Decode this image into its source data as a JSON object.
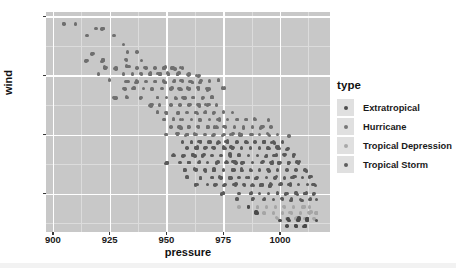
{
  "chart_data": {
    "type": "scatter",
    "title": "",
    "xlabel": "pressure",
    "ylabel": "wind",
    "xlim": [
      897,
      1022
    ],
    "ylim": [
      14,
      163
    ],
    "xticks": [
      900,
      925,
      950,
      975,
      1000
    ],
    "yticks": [
      40,
      80,
      120,
      160
    ],
    "grid": true,
    "legend": {
      "title": "type",
      "position": "right",
      "entries": [
        {
          "label": "Extratropical",
          "color": "#4d4d4d"
        },
        {
          "label": "Hurricane",
          "color": "#777777"
        },
        {
          "label": "Tropical Depression",
          "color": "#a8a8a8"
        },
        {
          "label": "Tropical Storm",
          "color": "#5e5e5e"
        }
      ]
    },
    "series": [
      {
        "name": "Hurricane",
        "color": "#6f6f6f",
        "points": [
          [
            905,
            155
          ],
          [
            910,
            155
          ],
          [
            915,
            147
          ],
          [
            919,
            152
          ],
          [
            922,
            152
          ],
          [
            927,
            147
          ],
          [
            931,
            141
          ],
          [
            918,
            135
          ],
          [
            933,
            136
          ],
          [
            937,
            136
          ],
          [
            915,
            130
          ],
          [
            922,
            130
          ],
          [
            932,
            131
          ],
          [
            939,
            130
          ],
          [
            923,
            125
          ],
          [
            928,
            125
          ],
          [
            933,
            126
          ],
          [
            937,
            125
          ],
          [
            941,
            125
          ],
          [
            945,
            125
          ],
          [
            949,
            125
          ],
          [
            953,
            125
          ],
          [
            957,
            125
          ],
          [
            920,
            121
          ],
          [
            931,
            121
          ],
          [
            935,
            121
          ],
          [
            939,
            121
          ],
          [
            943,
            121
          ],
          [
            947,
            121
          ],
          [
            951,
            121
          ],
          [
            955,
            121
          ],
          [
            960,
            121
          ],
          [
            964,
            120
          ],
          [
            925,
            117
          ],
          [
            933,
            116
          ],
          [
            937,
            116
          ],
          [
            941,
            116
          ],
          [
            945,
            116
          ],
          [
            949,
            116
          ],
          [
            953,
            116
          ],
          [
            957,
            116
          ],
          [
            961,
            116
          ],
          [
            965,
            116
          ],
          [
            969,
            116
          ],
          [
            973,
            117
          ],
          [
            931,
            111
          ],
          [
            936,
            111
          ],
          [
            940,
            111
          ],
          [
            944,
            111
          ],
          [
            948,
            111
          ],
          [
            952,
            111
          ],
          [
            956,
            111
          ],
          [
            960,
            111
          ],
          [
            964,
            111
          ],
          [
            968,
            111
          ],
          [
            975,
            111
          ],
          [
            927,
            105
          ],
          [
            933,
            105
          ],
          [
            939,
            105
          ],
          [
            946,
            105
          ],
          [
            950,
            105
          ],
          [
            954,
            105
          ],
          [
            958,
            105
          ],
          [
            962,
            105
          ],
          [
            966,
            105
          ],
          [
            970,
            105
          ],
          [
            943,
            100
          ],
          [
            947,
            100
          ],
          [
            952,
            100
          ],
          [
            956,
            100
          ],
          [
            960,
            100
          ],
          [
            964,
            100
          ],
          [
            968,
            100
          ],
          [
            972,
            100
          ],
          [
            946,
            95
          ],
          [
            950,
            95
          ],
          [
            955,
            95
          ],
          [
            959,
            95
          ],
          [
            963,
            95
          ],
          [
            967,
            95
          ],
          [
            971,
            95
          ],
          [
            975,
            95
          ],
          [
            979,
            95
          ],
          [
            949,
            90
          ],
          [
            953,
            90
          ],
          [
            957,
            90
          ],
          [
            961,
            90
          ],
          [
            965,
            90
          ],
          [
            969,
            90
          ],
          [
            973,
            90
          ],
          [
            977,
            90
          ],
          [
            981,
            90
          ],
          [
            985,
            90
          ],
          [
            989,
            90
          ],
          [
            995,
            90
          ],
          [
            952,
            85
          ],
          [
            956,
            85
          ],
          [
            960,
            85
          ],
          [
            964,
            85
          ],
          [
            968,
            85
          ],
          [
            972,
            85
          ],
          [
            976,
            85
          ],
          [
            980,
            85
          ],
          [
            984,
            85
          ],
          [
            988,
            85
          ],
          [
            992,
            85
          ],
          [
            996,
            85
          ],
          [
            950,
            80
          ],
          [
            955,
            80
          ],
          [
            959,
            80
          ],
          [
            963,
            80
          ],
          [
            967,
            80
          ],
          [
            971,
            80
          ],
          [
            975,
            80
          ],
          [
            979,
            80
          ],
          [
            983,
            80
          ],
          [
            987,
            80
          ],
          [
            991,
            80
          ],
          [
            995,
            80
          ],
          [
            999,
            80
          ],
          [
            1004,
            79
          ]
        ]
      },
      {
        "name": "Tropical Storm",
        "color": "#5a5a5a",
        "points": [
          [
            957,
            75
          ],
          [
            961,
            75
          ],
          [
            965,
            75
          ],
          [
            969,
            75
          ],
          [
            973,
            75
          ],
          [
            977,
            75
          ],
          [
            981,
            75
          ],
          [
            985,
            75
          ],
          [
            989,
            75
          ],
          [
            993,
            75
          ],
          [
            997,
            75
          ],
          [
            1001,
            75
          ],
          [
            959,
            71
          ],
          [
            963,
            71
          ],
          [
            967,
            71
          ],
          [
            971,
            71
          ],
          [
            975,
            71
          ],
          [
            979,
            71
          ],
          [
            983,
            71
          ],
          [
            987,
            71
          ],
          [
            991,
            71
          ],
          [
            995,
            71
          ],
          [
            999,
            71
          ],
          [
            1003,
            70
          ],
          [
            953,
            66
          ],
          [
            958,
            66
          ],
          [
            962,
            66
          ],
          [
            966,
            66
          ],
          [
            970,
            66
          ],
          [
            974,
            66
          ],
          [
            978,
            66
          ],
          [
            982,
            66
          ],
          [
            986,
            66
          ],
          [
            990,
            66
          ],
          [
            994,
            66
          ],
          [
            998,
            66
          ],
          [
            1002,
            66
          ],
          [
            1006,
            66
          ],
          [
            950,
            61
          ],
          [
            956,
            61
          ],
          [
            960,
            61
          ],
          [
            964,
            61
          ],
          [
            968,
            61
          ],
          [
            972,
            61
          ],
          [
            976,
            61
          ],
          [
            980,
            61
          ],
          [
            984,
            61
          ],
          [
            988,
            61
          ],
          [
            992,
            61
          ],
          [
            996,
            61
          ],
          [
            1000,
            61
          ],
          [
            1004,
            61
          ],
          [
            1008,
            61
          ],
          [
            958,
            56
          ],
          [
            963,
            56
          ],
          [
            967,
            56
          ],
          [
            971,
            56
          ],
          [
            975,
            56
          ],
          [
            979,
            56
          ],
          [
            983,
            56
          ],
          [
            987,
            56
          ],
          [
            991,
            56
          ],
          [
            995,
            56
          ],
          [
            999,
            56
          ],
          [
            1003,
            56
          ],
          [
            1007,
            56
          ],
          [
            1011,
            56
          ],
          [
            959,
            51
          ],
          [
            965,
            51
          ],
          [
            970,
            51
          ],
          [
            974,
            51
          ],
          [
            978,
            51
          ],
          [
            982,
            51
          ],
          [
            986,
            51
          ],
          [
            990,
            51
          ],
          [
            994,
            51
          ],
          [
            998,
            51
          ],
          [
            1002,
            51
          ],
          [
            1006,
            51
          ],
          [
            1010,
            51
          ],
          [
            1013,
            51
          ],
          [
            963,
            46
          ],
          [
            968,
            46
          ],
          [
            972,
            46
          ],
          [
            976,
            46
          ],
          [
            980,
            46
          ],
          [
            984,
            46
          ],
          [
            988,
            46
          ],
          [
            992,
            46
          ],
          [
            996,
            46
          ],
          [
            1000,
            46
          ],
          [
            1004,
            46
          ],
          [
            1008,
            46
          ],
          [
            1012,
            46
          ],
          [
            1015,
            46
          ],
          [
            975,
            40
          ],
          [
            982,
            40
          ],
          [
            987,
            40
          ],
          [
            991,
            40
          ],
          [
            995,
            40
          ],
          [
            999,
            40
          ],
          [
            1003,
            40
          ],
          [
            1007,
            40
          ],
          [
            1011,
            40
          ],
          [
            1015,
            40
          ],
          [
            981,
            36
          ],
          [
            988,
            36
          ],
          [
            993,
            36
          ],
          [
            997,
            36
          ],
          [
            1001,
            36
          ],
          [
            1005,
            36
          ],
          [
            1009,
            36
          ],
          [
            1013,
            36
          ],
          [
            1016,
            36
          ]
        ]
      },
      {
        "name": "Tropical Depression",
        "color": "#a5a5a5",
        "points": [
          [
            982,
            31
          ],
          [
            990,
            31
          ],
          [
            994,
            31
          ],
          [
            998,
            31
          ],
          [
            1002,
            31
          ],
          [
            1006,
            31
          ],
          [
            1010,
            31
          ],
          [
            1013,
            31
          ],
          [
            993,
            27
          ],
          [
            997,
            27
          ],
          [
            1001,
            27
          ],
          [
            1005,
            27
          ],
          [
            1009,
            27
          ],
          [
            1013,
            27
          ],
          [
            1016,
            27
          ],
          [
            999,
            23
          ],
          [
            1003,
            23
          ],
          [
            1007,
            23
          ],
          [
            1011,
            23
          ],
          [
            1015,
            23
          ]
        ]
      },
      {
        "name": "Extratropical",
        "color": "#4a4a4a",
        "points": [
          [
            1000,
            22
          ],
          [
            1004,
            22
          ],
          [
            1008,
            22
          ],
          [
            1012,
            22
          ],
          [
            1016,
            22
          ],
          [
            1003,
            18
          ],
          [
            1007,
            18
          ],
          [
            1011,
            18
          ],
          [
            986,
            31
          ],
          [
            990,
            27
          ],
          [
            1008,
            23
          ],
          [
            1012,
            23
          ]
        ]
      }
    ]
  }
}
